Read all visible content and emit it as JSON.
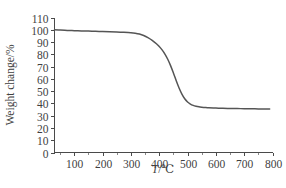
{
  "figure": {
    "background_color": "#ffffff",
    "curve_color": "#555555",
    "axis_color": "#4a4a4a"
  },
  "axes": {
    "x": {
      "title_symbol": "T",
      "title_unit": "/℃",
      "title_full": "T/℃",
      "min": 30,
      "max": 800,
      "tick_labels": [
        "100",
        "200",
        "300",
        "400",
        "500",
        "600",
        "700",
        "800"
      ],
      "tick_values": [
        100,
        200,
        300,
        400,
        500,
        600,
        700,
        800
      ],
      "minor_tick_values": [
        50,
        150,
        250,
        350,
        450,
        550,
        650,
        750
      ]
    },
    "y": {
      "title_full": "Weight change/%",
      "min": 0,
      "max": 110,
      "tick_labels": [
        "0",
        "10",
        "20",
        "30",
        "40",
        "50",
        "60",
        "70",
        "80",
        "90",
        "100",
        "110"
      ],
      "tick_values": [
        0,
        10,
        20,
        30,
        40,
        50,
        60,
        70,
        80,
        90,
        100,
        110
      ]
    }
  },
  "chart_data": {
    "type": "line",
    "title": "",
    "xlabel": "T/℃",
    "ylabel": "Weight change/%",
    "xlim": [
      30,
      800
    ],
    "ylim": [
      0,
      110
    ],
    "grid": false,
    "legend": null,
    "series": [
      {
        "name": "Weight change",
        "x": [
          30,
          50,
          75,
          100,
          125,
          150,
          175,
          200,
          225,
          250,
          275,
          300,
          315,
          330,
          345,
          360,
          375,
          390,
          400,
          410,
          420,
          430,
          440,
          450,
          460,
          470,
          480,
          490,
          500,
          510,
          520,
          530,
          540,
          550,
          560,
          575,
          600,
          625,
          650,
          675,
          700,
          725,
          750,
          775,
          790
        ],
        "y": [
          100.0,
          99.8,
          99.5,
          99.3,
          99.1,
          98.9,
          98.7,
          98.5,
          98.3,
          98.1,
          97.9,
          97.6,
          97.2,
          96.5,
          95.3,
          93.6,
          91.4,
          88.6,
          86.4,
          83.6,
          80.2,
          76.0,
          70.8,
          64.8,
          58.5,
          52.6,
          47.6,
          43.8,
          41.2,
          39.5,
          38.4,
          37.7,
          37.2,
          36.9,
          36.7,
          36.4,
          36.2,
          36.0,
          35.9,
          35.8,
          35.7,
          35.6,
          35.5,
          35.4,
          35.4
        ]
      }
    ],
    "annotations": [
      {
        "label": "initial plateau",
        "value": 100
      },
      {
        "label": "final residue",
        "value": 35.4
      },
      {
        "label": "inflection temperature",
        "value": 448
      }
    ]
  }
}
